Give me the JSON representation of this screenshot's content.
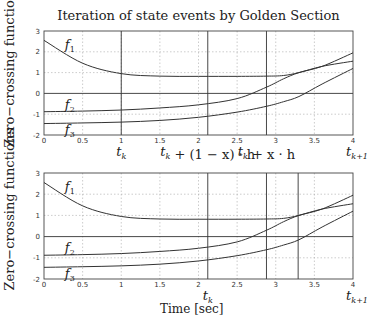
{
  "title": "Iteration of state events by Golden Section",
  "ylabel": "Zero−crossing functions",
  "xlabel": "Time [sec]",
  "chart_data": [
    {
      "type": "line",
      "title": "Iteration of state events by Golden Section",
      "xlabel": "",
      "ylabel": "Zero−crossing functions",
      "xlim": [
        0,
        4
      ],
      "ylim": [
        -2,
        3
      ],
      "xticks": [
        "0",
        "0.5",
        "1",
        "1.5",
        "2",
        "2.5",
        "3",
        "3.5",
        "4"
      ],
      "yticks": [
        "3",
        "2",
        "1",
        "0",
        "-1",
        "-2"
      ],
      "grid": true,
      "x": [
        0,
        0.5,
        1,
        1.5,
        2,
        2.5,
        2.88,
        3.1,
        3.3,
        3.6,
        4
      ],
      "series": [
        {
          "name": "f1",
          "values": [
            2.55,
            1.45,
            0.95,
            0.83,
            0.82,
            0.82,
            0.83,
            0.86,
            1.0,
            1.3,
            1.55
          ]
        },
        {
          "name": "f2",
          "values": [
            -0.88,
            -0.85,
            -0.8,
            -0.7,
            -0.55,
            -0.25,
            0.3,
            0.7,
            1.0,
            1.3,
            1.95
          ]
        },
        {
          "name": "f3",
          "values": [
            -1.45,
            -1.42,
            -1.38,
            -1.3,
            -1.15,
            -0.9,
            -0.62,
            -0.4,
            -0.15,
            0.45,
            1.2
          ]
        }
      ],
      "vertical_lines": [
        1.0,
        2.12,
        2.88
      ],
      "annotations": [
        {
          "x": 1.0,
          "text": "t_k"
        },
        {
          "x": 2.12,
          "text": "t_k + (1 − x) · h"
        },
        {
          "x": 2.88,
          "text": "t_k + x · h"
        },
        {
          "x": 4.0,
          "text": "t_{k+1}"
        }
      ],
      "curve_labels": [
        "f1",
        "f2",
        "f3"
      ]
    },
    {
      "type": "line",
      "title": "",
      "xlabel": "Time [sec]",
      "ylabel": "Zero−crossing functions",
      "xlim": [
        0,
        4
      ],
      "ylim": [
        -2,
        3
      ],
      "xticks": [
        "0",
        "0.5",
        "1",
        "1.5",
        "2",
        "2.5",
        "3",
        "3.5",
        "4"
      ],
      "yticks": [
        "3",
        "2",
        "1",
        "0",
        "-1",
        "-2"
      ],
      "grid": true,
      "x": [
        0,
        0.5,
        1,
        1.5,
        2,
        2.5,
        2.88,
        3.1,
        3.3,
        3.6,
        4
      ],
      "series": [
        {
          "name": "f1",
          "values": [
            2.55,
            1.45,
            0.95,
            0.83,
            0.82,
            0.82,
            0.83,
            0.86,
            1.0,
            1.3,
            1.55
          ]
        },
        {
          "name": "f2",
          "values": [
            -0.88,
            -0.85,
            -0.8,
            -0.7,
            -0.55,
            -0.25,
            0.3,
            0.7,
            1.0,
            1.3,
            1.95
          ]
        },
        {
          "name": "f3",
          "values": [
            -1.45,
            -1.42,
            -1.38,
            -1.3,
            -1.15,
            -0.9,
            -0.62,
            -0.4,
            -0.15,
            0.45,
            1.2
          ]
        }
      ],
      "vertical_lines": [
        2.12,
        2.88,
        3.29
      ],
      "annotations": [
        {
          "x": 2.12,
          "text": "t_k"
        },
        {
          "x": 4.0,
          "text": "t_{k+1}"
        }
      ],
      "curve_labels": [
        "f1",
        "f2",
        "f3"
      ]
    }
  ]
}
